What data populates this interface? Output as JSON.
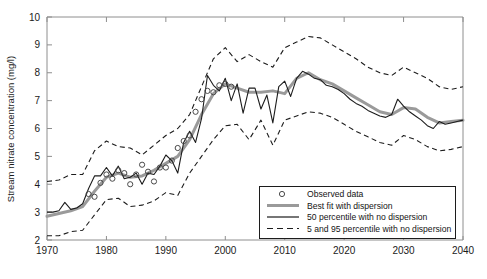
{
  "chart_data": {
    "type": "line",
    "title": "",
    "xlabel": "",
    "ylabel": "Stream nitrate concentration (mg/l)",
    "xlim": [
      1970,
      2040
    ],
    "ylim": [
      2,
      10
    ],
    "xticks": [
      1970,
      1980,
      1990,
      2000,
      2010,
      2020,
      2030,
      2040
    ],
    "yticks": [
      2,
      3,
      4,
      5,
      6,
      7,
      8,
      9,
      10
    ],
    "grid": false,
    "legend_position": "bottom-right",
    "series": [
      {
        "name": "Observed data",
        "style": "markers",
        "marker": "open-circle",
        "color": "#4a4a4a",
        "x": [
          1977,
          1978,
          1979,
          1980,
          1981,
          1982,
          1983,
          1984,
          1985,
          1986,
          1987,
          1988,
          1989,
          1990,
          1991,
          1992,
          1993,
          1994,
          1995,
          1996,
          1997,
          1998,
          1999,
          2000,
          2001
        ],
        "y": [
          3.65,
          3.55,
          4.05,
          4.35,
          4.2,
          4.5,
          4.4,
          4.0,
          4.35,
          4.7,
          4.45,
          4.1,
          4.6,
          4.6,
          4.85,
          5.3,
          5.55,
          5.75,
          6.6,
          7.05,
          7.35,
          7.3,
          7.55,
          7.6,
          7.5
        ]
      },
      {
        "name": "Best fit with dispersion",
        "style": "solid-thick",
        "color": "#9a9a9a",
        "x": [
          1970,
          1972,
          1974,
          1976,
          1978,
          1980,
          1982,
          1984,
          1986,
          1988,
          1990,
          1992,
          1994,
          1996,
          1998,
          2000,
          2002,
          2004,
          2006,
          2008,
          2010,
          2012,
          2014,
          2016,
          2018,
          2020,
          2022,
          2024,
          2026,
          2028,
          2030,
          2032,
          2034,
          2036,
          2038,
          2040
        ],
        "y": [
          2.85,
          2.95,
          3.05,
          3.2,
          3.75,
          4.25,
          4.4,
          4.25,
          4.3,
          4.5,
          4.75,
          5.0,
          5.6,
          6.5,
          7.25,
          7.6,
          7.45,
          7.3,
          7.3,
          7.35,
          7.25,
          7.8,
          8.0,
          7.75,
          7.6,
          7.35,
          7.1,
          6.85,
          6.6,
          6.5,
          6.75,
          6.7,
          6.4,
          6.2,
          6.25,
          6.3
        ]
      },
      {
        "name": "50 percentile with no dispersion",
        "style": "solid-thin",
        "color": "#1c1c1c",
        "x": [
          1970,
          1971,
          1972,
          1973,
          1974,
          1975,
          1976,
          1977,
          1978,
          1979,
          1980,
          1981,
          1982,
          1983,
          1984,
          1985,
          1986,
          1987,
          1988,
          1989,
          1990,
          1991,
          1992,
          1993,
          1994,
          1995,
          1996,
          1997,
          1998,
          1999,
          2000,
          2001,
          2002,
          2003,
          2004,
          2005,
          2006,
          2007,
          2008,
          2009,
          2010,
          2011,
          2012,
          2013,
          2014,
          2015,
          2016,
          2017,
          2018,
          2019,
          2020,
          2021,
          2022,
          2023,
          2024,
          2025,
          2026,
          2027,
          2028,
          2029,
          2030,
          2031,
          2032,
          2033,
          2034,
          2035,
          2036,
          2037,
          2038,
          2039,
          2040
        ],
        "y": [
          3.0,
          3.0,
          3.05,
          3.35,
          3.1,
          3.15,
          3.3,
          3.85,
          4.3,
          4.3,
          4.6,
          4.3,
          4.65,
          4.2,
          4.25,
          4.4,
          4.0,
          4.4,
          4.35,
          4.65,
          5.05,
          4.85,
          4.4,
          5.5,
          5.9,
          5.5,
          6.35,
          7.9,
          7.55,
          7.35,
          7.8,
          7.0,
          7.6,
          6.55,
          7.45,
          7.45,
          6.7,
          7.2,
          6.2,
          7.5,
          7.7,
          7.15,
          7.8,
          8.05,
          7.95,
          7.8,
          7.75,
          7.55,
          7.5,
          7.4,
          7.25,
          7.05,
          6.9,
          6.8,
          6.65,
          6.55,
          6.45,
          6.4,
          6.5,
          7.05,
          6.8,
          6.6,
          6.45,
          6.3,
          6.1,
          6.0,
          6.25,
          6.15,
          6.2,
          6.25,
          6.3
        ]
      },
      {
        "name": "5 and 95 percentile with no dispersion",
        "style": "dashed",
        "color": "#1c1c1c",
        "upper": {
          "x": [
            1970,
            1972,
            1974,
            1976,
            1978,
            1980,
            1982,
            1984,
            1986,
            1988,
            1990,
            1992,
            1994,
            1996,
            1998,
            2000,
            2002,
            2004,
            2006,
            2008,
            2010,
            2012,
            2014,
            2016,
            2018,
            2020,
            2022,
            2024,
            2026,
            2028,
            2030,
            2032,
            2034,
            2036,
            2038,
            2040
          ],
          "y": [
            4.1,
            4.15,
            4.35,
            4.35,
            5.2,
            5.55,
            5.35,
            5.3,
            5.05,
            5.4,
            5.75,
            6.0,
            6.5,
            7.5,
            8.5,
            8.9,
            8.4,
            8.65,
            8.4,
            8.2,
            8.9,
            9.1,
            9.3,
            9.25,
            9.0,
            8.75,
            8.5,
            8.2,
            8.0,
            7.9,
            8.2,
            8.0,
            7.8,
            7.5,
            7.4,
            7.5
          ]
        },
        "lower": {
          "x": [
            1970,
            1972,
            1974,
            1976,
            1978,
            1980,
            1982,
            1984,
            1986,
            1988,
            1990,
            1992,
            1994,
            1996,
            1998,
            2000,
            2002,
            2004,
            2006,
            2008,
            2010,
            2012,
            2014,
            2016,
            2018,
            2020,
            2022,
            2024,
            2026,
            2028,
            2030,
            2032,
            2034,
            2036,
            2038,
            2040
          ],
          "y": [
            2.15,
            2.15,
            2.3,
            2.35,
            2.9,
            3.45,
            3.5,
            3.2,
            3.25,
            3.4,
            3.7,
            3.6,
            4.4,
            5.0,
            5.6,
            6.1,
            6.15,
            5.6,
            6.3,
            5.4,
            6.3,
            6.45,
            6.6,
            6.55,
            6.4,
            6.15,
            5.9,
            5.7,
            5.5,
            5.4,
            5.75,
            5.6,
            5.35,
            5.2,
            5.25,
            5.35
          ]
        }
      }
    ]
  },
  "legend": {
    "entries": [
      {
        "label": "Observed data",
        "swatch": "open-circle"
      },
      {
        "label": "Best fit with dispersion",
        "swatch": "thick-gray-line"
      },
      {
        "label": "50 percentile with no dispersion",
        "swatch": "thin-black-line"
      },
      {
        "label": "5 and 95 percentile with no dispersion",
        "swatch": "dashed-black-line"
      }
    ]
  },
  "colors": {
    "best_fit": "#9a9a9a",
    "percentile_50": "#1c1c1c",
    "percentile_bounds": "#1c1c1c",
    "observed_marker": "#4a4a4a",
    "axis": "#8e8e8e",
    "text": "#1a1a1a"
  }
}
